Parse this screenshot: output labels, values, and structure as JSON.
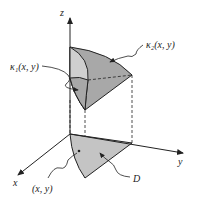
{
  "diagram": {
    "type": "3d-solid-between-surfaces",
    "axes": {
      "z_label": "z",
      "x_label": "x",
      "y_label": "y"
    },
    "labels": {
      "upper_surface": "κ₂(x, y)",
      "lower_surface": "κ₁(x, y)",
      "point": "(x, y)",
      "region": "D"
    },
    "colors": {
      "solid_dark": "#a8a8a8",
      "solid_light": "#cfcfcf",
      "region_fill": "#c4c4c4",
      "stroke": "#222222"
    }
  }
}
